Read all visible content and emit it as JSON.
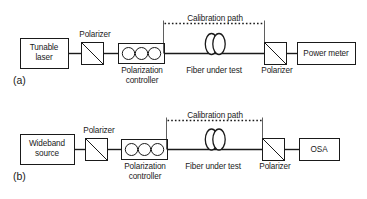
{
  "figure": {
    "type": "optical-measurement-schematic",
    "panels": [
      {
        "id": "a",
        "panel_label": "(a)",
        "source_label": "Tunable\nlaser",
        "source_line1": "Tunable",
        "source_line2": "laser",
        "input_polarizer_label": "Polarizer",
        "controller_line1": "Polarization",
        "controller_line2": "controller",
        "fiber_label": "Fiber under test",
        "calibration_label": "Calibration path",
        "output_polarizer_label": "Polarizer",
        "detector_label": "Power meter"
      },
      {
        "id": "b",
        "panel_label": "(b)",
        "source_label": "Wideband\nsource",
        "source_line1": "Wideband",
        "source_line2": "source",
        "input_polarizer_label": "Polarizer",
        "controller_line1": "Polarization",
        "controller_line2": "controller",
        "fiber_label": "Fiber under test",
        "calibration_label": "Calibration path",
        "output_polarizer_label": "Polarizer",
        "detector_label": "OSA"
      }
    ],
    "colors": {
      "stroke": "#1a1a1a",
      "fill": "#ffffff",
      "background": "#ffffff"
    },
    "icons": {
      "polarizer": "polarizer-icon",
      "polarization_controller": "polarization-controller-icon",
      "fiber_coil": "fiber-coil-icon",
      "calibration_path": "dotted-bypass-icon"
    }
  }
}
